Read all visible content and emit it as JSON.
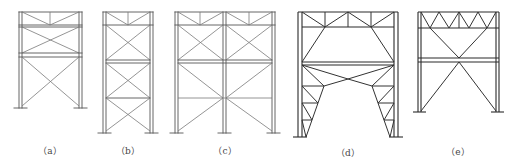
{
  "figure": {
    "panels": [
      {
        "id": "a",
        "label": "（a）",
        "type": "single-bay frame, roof truss with X bracing in upper tier and large X bracing in lower tier"
      },
      {
        "id": "b",
        "label": "（b）",
        "type": "single-bay frame, roof truss with three tiers of X bracing"
      },
      {
        "id": "c",
        "label": "（c）",
        "type": "two-bay frame, roof truss with X bracing in upper tier and K/X bracing in lower tiers"
      },
      {
        "id": "d",
        "label": "（d）",
        "type": "single-bay portal frame with knee-braced truss columns and diamond bracing"
      },
      {
        "id": "e",
        "label": "（e）",
        "type": "single-bay frame with Warren roof truss and large X bracing"
      }
    ]
  }
}
